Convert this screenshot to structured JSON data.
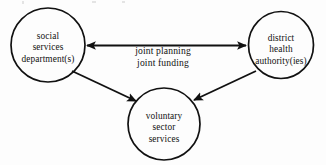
{
  "diagram": {
    "type": "relationship-diagram",
    "background_color": "#fdfdfd",
    "stroke_color": "#111111",
    "nodes": [
      {
        "id": "social-services",
        "shape": "circle",
        "lines": [
          "social",
          "services",
          "department(s)"
        ],
        "line1": "social",
        "line2": "services",
        "line3": "department(s)",
        "cx": 48,
        "cy": 45,
        "r": 37
      },
      {
        "id": "district-health",
        "shape": "circle",
        "lines": [
          "district",
          "health",
          "authority(ies)"
        ],
        "line1": "district",
        "line2": "health",
        "line3": "authority(ies)",
        "cx": 281,
        "cy": 45,
        "r": 33
      },
      {
        "id": "voluntary-sector",
        "shape": "circle",
        "lines": [
          "voluntary",
          "sector",
          "services"
        ],
        "line1": "voluntary",
        "line2": "sector",
        "line3": "services",
        "cx": 164,
        "cy": 124,
        "r": 36
      }
    ],
    "edges": [
      {
        "id": "social-to-district",
        "from": "social-services",
        "to": "district-health",
        "arrowheads": "both",
        "label_line1": "joint planning",
        "label_line2": "joint funding"
      },
      {
        "id": "social-to-voluntary",
        "from": "social-services",
        "to": "voluntary-sector",
        "arrowheads": "end"
      },
      {
        "id": "district-to-voluntary",
        "from": "district-health",
        "to": "voluntary-sector",
        "arrowheads": "end"
      }
    ],
    "edge_label": {
      "line1": "joint planning",
      "line2": "joint funding"
    }
  }
}
